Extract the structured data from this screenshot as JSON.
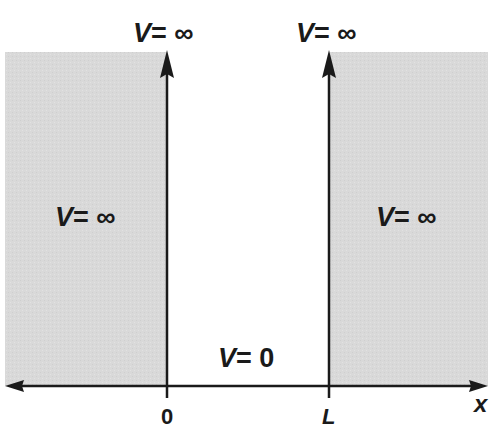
{
  "diagram": {
    "colors": {
      "forbidden_region": "#d9d9d9",
      "allowed_region": "#ffffff",
      "lines": "#1a1a1a"
    },
    "regions": [
      {
        "name": "left-barrier",
        "label_var": "V",
        "label_eq": "= ∞"
      },
      {
        "name": "well",
        "label_var": "V",
        "label_eq": "= 0"
      },
      {
        "name": "right-barrier",
        "label_var": "V",
        "label_eq": "= ∞"
      }
    ],
    "walls": [
      {
        "name": "wall-at-0",
        "top_label_var": "V",
        "top_label_eq": "= ∞",
        "tick_label": "0"
      },
      {
        "name": "wall-at-L",
        "top_label_var": "V",
        "top_label_eq": "= ∞",
        "tick_label": "L"
      }
    ],
    "x_axis": {
      "label": "x"
    }
  }
}
